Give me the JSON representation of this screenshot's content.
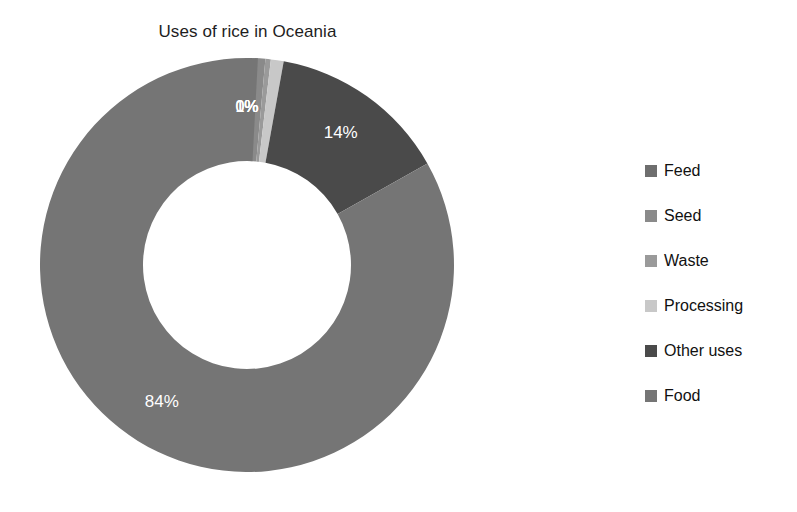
{
  "chart_data": {
    "type": "pie",
    "variant": "donut",
    "title": "Uses of rice in Oceania",
    "xlabel": "",
    "ylabel": "",
    "grid": false,
    "legend_position": "right",
    "hole_ratio": 0.5,
    "start_angle_deg": 0,
    "direction": "clockwise",
    "categories": [
      "Feed",
      "Seed",
      "Waste",
      "Processing",
      "Other uses",
      "Food"
    ],
    "values": [
      0,
      1,
      0,
      1,
      14,
      84
    ],
    "labels": [
      "0%",
      "1%",
      "0%",
      "1%",
      "14%",
      "84%"
    ],
    "colors": [
      "#6e6e6e",
      "#8a8a8a",
      "#9a9a9a",
      "#c8c8c8",
      "#4a4a4a",
      "#757575"
    ],
    "slices": [
      {
        "name": "Feed",
        "value": 0,
        "label": "0%",
        "color": "#6e6e6e"
      },
      {
        "name": "Seed",
        "value": 1,
        "label": "1%",
        "color": "#8a8a8a"
      },
      {
        "name": "Waste",
        "value": 0,
        "label": "0%",
        "color": "#9a9a9a"
      },
      {
        "name": "Processing",
        "value": 1,
        "label": "1%",
        "color": "#c8c8c8"
      },
      {
        "name": "Other uses",
        "value": 14,
        "label": "14%",
        "color": "#4a4a4a"
      },
      {
        "name": "Food",
        "value": 84,
        "label": "84%",
        "color": "#757575"
      }
    ]
  },
  "legend": {
    "items": [
      {
        "label": "Feed",
        "color": "#6e6e6e"
      },
      {
        "label": "Seed",
        "color": "#8a8a8a"
      },
      {
        "label": "Waste",
        "color": "#9a9a9a"
      },
      {
        "label": "Processing",
        "color": "#c8c8c8"
      },
      {
        "label": "Other uses",
        "color": "#4a4a4a"
      },
      {
        "label": "Food",
        "color": "#757575"
      }
    ]
  },
  "overlap_labels": {
    "combined": "0%1%0%1%"
  }
}
